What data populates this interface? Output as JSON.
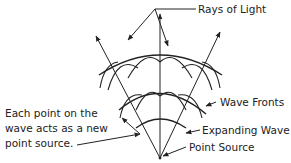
{
  "diagram": {
    "labels": {
      "rays_of_light": "Rays of Light",
      "wave_fronts": "Wave Fronts",
      "expanding_wave": "Expanding Wave",
      "point_source": "Point Source",
      "huygens_line1": "Each point on the",
      "huygens_line2": "wave acts as a new",
      "huygens_line3": "point source."
    },
    "colors": {
      "ink": "#222222",
      "background": "#ffffff"
    }
  }
}
